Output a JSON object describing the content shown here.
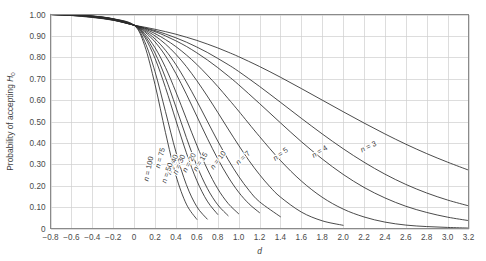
{
  "chart_data": {
    "type": "line",
    "title": "",
    "xlabel": "d",
    "ylabel": "Probability of accepting H0",
    "ylabel_main": "Probability of accepting ",
    "ylabel_symbol": "H",
    "ylabel_subscript": "0",
    "xlim": [
      -0.8,
      3.2
    ],
    "ylim": [
      0,
      1.0
    ],
    "grid": true,
    "legend_position": "inline-curve-labels",
    "x_ticks": [
      "-0.8",
      "-0.6",
      "-0.4",
      "-0.2",
      "0",
      "0.2",
      "0.4",
      "0.6",
      "0.8",
      "1.0",
      "1.2",
      "1.4",
      "1.6",
      "1.8",
      "2.0",
      "2.2",
      "2.4",
      "2.6",
      "2.8",
      "3.0",
      "3.2"
    ],
    "x_tick_values": [
      -0.8,
      -0.6,
      -0.4,
      -0.2,
      0,
      0.2,
      0.4,
      0.6,
      0.8,
      1.0,
      1.2,
      1.4,
      1.6,
      1.8,
      2.0,
      2.2,
      2.4,
      2.6,
      2.8,
      3.0,
      3.2
    ],
    "y_ticks": [
      "0",
      "0.10",
      "0.20",
      "0.30",
      "0.40",
      "0.50",
      "0.60",
      "0.70",
      "0.80",
      "0.90",
      "1.00"
    ],
    "y_tick_values": [
      0,
      0.1,
      0.2,
      0.3,
      0.4,
      0.5,
      0.6,
      0.7,
      0.8,
      0.9,
      1.0
    ],
    "series": [
      {
        "name": "n = 3",
        "label_prefix": "n",
        "label_equals": " = ",
        "label_value": "3",
        "label_x": 2.18,
        "label_y": 0.355,
        "label_rotate": -26,
        "x": [
          -0.8,
          -0.6,
          -0.4,
          -0.2,
          0,
          0.1,
          0.2,
          0.3,
          0.4,
          0.5,
          0.6,
          0.7,
          0.8,
          0.9,
          1.0,
          1.2,
          1.4,
          1.6,
          1.8,
          2.0,
          2.2,
          2.4,
          2.6,
          2.8,
          3.0,
          3.2
        ],
        "values": [
          1.0,
          0.995,
          0.986,
          0.973,
          0.95,
          0.941,
          0.931,
          0.92,
          0.908,
          0.894,
          0.879,
          0.862,
          0.844,
          0.824,
          0.803,
          0.757,
          0.707,
          0.654,
          0.6,
          0.546,
          0.493,
          0.442,
          0.394,
          0.35,
          0.31,
          0.273
        ]
      },
      {
        "name": "n = 4",
        "label_prefix": "n",
        "label_equals": " = ",
        "label_value": "4",
        "label_x": 1.72,
        "label_y": 0.33,
        "label_rotate": -32,
        "x": [
          -0.8,
          -0.6,
          -0.4,
          -0.2,
          0,
          0.1,
          0.2,
          0.3,
          0.4,
          0.5,
          0.6,
          0.7,
          0.8,
          0.9,
          1.0,
          1.2,
          1.4,
          1.6,
          1.8,
          2.0,
          2.2,
          2.4,
          2.6,
          2.8,
          3.0,
          3.2
        ],
        "values": [
          1.0,
          0.996,
          0.988,
          0.974,
          0.95,
          0.938,
          0.925,
          0.909,
          0.891,
          0.871,
          0.848,
          0.823,
          0.795,
          0.766,
          0.734,
          0.664,
          0.59,
          0.515,
          0.442,
          0.373,
          0.31,
          0.254,
          0.206,
          0.166,
          0.133,
          0.106
        ]
      },
      {
        "name": "n = 5",
        "label_prefix": "n",
        "label_equals": " = ",
        "label_value": "5",
        "label_x": 1.35,
        "label_y": 0.315,
        "label_rotate": -37,
        "x": [
          -0.8,
          -0.6,
          -0.4,
          -0.2,
          0,
          0.1,
          0.2,
          0.3,
          0.4,
          0.5,
          0.6,
          0.7,
          0.8,
          0.9,
          1.0,
          1.2,
          1.4,
          1.6,
          1.8,
          2.0,
          2.2,
          2.4,
          2.6,
          2.8,
          3.0,
          3.2
        ],
        "values": [
          1.0,
          0.996,
          0.988,
          0.974,
          0.95,
          0.936,
          0.92,
          0.9,
          0.877,
          0.851,
          0.821,
          0.788,
          0.752,
          0.713,
          0.672,
          0.584,
          0.494,
          0.406,
          0.325,
          0.253,
          0.192,
          0.143,
          0.104,
          0.075,
          0.053,
          0.037
        ]
      },
      {
        "name": "n = 7",
        "label_prefix": "n",
        "label_equals": " = ",
        "label_value": "7",
        "label_x": 1.0,
        "label_y": 0.295,
        "label_rotate": -44,
        "x": [
          -0.8,
          -0.6,
          -0.4,
          -0.2,
          0,
          0.1,
          0.2,
          0.3,
          0.4,
          0.5,
          0.6,
          0.7,
          0.8,
          0.9,
          1.0,
          1.2,
          1.4,
          1.6,
          1.8,
          2.0,
          2.2,
          2.4,
          2.6,
          2.8,
          3.0,
          3.2
        ],
        "values": [
          1.0,
          0.997,
          0.989,
          0.975,
          0.95,
          0.933,
          0.911,
          0.883,
          0.85,
          0.811,
          0.767,
          0.717,
          0.664,
          0.607,
          0.549,
          0.43,
          0.318,
          0.222,
          0.146,
          0.091,
          0.054,
          0.03,
          0.016,
          0.009,
          0.005,
          0.002
        ]
      },
      {
        "name": "n = 10",
        "label_prefix": "n",
        "label_equals": " = ",
        "label_value": "10",
        "label_x": 0.76,
        "label_y": 0.275,
        "label_rotate": -52,
        "x": [
          -0.8,
          -0.6,
          -0.4,
          -0.2,
          0,
          0.1,
          0.2,
          0.3,
          0.4,
          0.5,
          0.6,
          0.7,
          0.8,
          0.9,
          1.0,
          1.1,
          1.2,
          1.3,
          1.4,
          1.6,
          1.8,
          2.0
        ],
        "values": [
          1.0,
          0.997,
          0.99,
          0.976,
          0.95,
          0.929,
          0.9,
          0.862,
          0.814,
          0.757,
          0.691,
          0.619,
          0.543,
          0.465,
          0.389,
          0.317,
          0.252,
          0.195,
          0.147,
          0.077,
          0.036,
          0.015
        ]
      },
      {
        "name": "n = 15",
        "label_prefix": "n",
        "label_equals": " = ",
        "label_value": "15",
        "label_x": 0.6,
        "label_y": 0.265,
        "label_rotate": -58,
        "x": [
          -0.8,
          -0.6,
          -0.4,
          -0.2,
          0,
          0.1,
          0.2,
          0.3,
          0.4,
          0.5,
          0.6,
          0.7,
          0.8,
          0.9,
          1.0,
          1.1,
          1.2,
          1.4
        ],
        "values": [
          1.0,
          0.998,
          0.991,
          0.977,
          0.95,
          0.924,
          0.886,
          0.833,
          0.766,
          0.685,
          0.596,
          0.502,
          0.409,
          0.322,
          0.244,
          0.178,
          0.125,
          0.055
        ]
      },
      {
        "name": "n = 20",
        "label_prefix": "n",
        "label_equals": " = ",
        "label_value": "20",
        "label_x": 0.5,
        "label_y": 0.26,
        "label_rotate": -62,
        "x": [
          -0.8,
          -0.6,
          -0.4,
          -0.2,
          0,
          0.1,
          0.2,
          0.3,
          0.4,
          0.5,
          0.6,
          0.7,
          0.8,
          0.9,
          1.0,
          1.1,
          1.2
        ],
        "values": [
          1.0,
          0.998,
          0.991,
          0.978,
          0.95,
          0.919,
          0.872,
          0.807,
          0.724,
          0.628,
          0.525,
          0.422,
          0.326,
          0.241,
          0.17,
          0.115,
          0.074
        ]
      },
      {
        "name": "n = 30",
        "label_prefix": "n",
        "label_equals": " = ",
        "label_value": "30",
        "label_x": 0.41,
        "label_y": 0.25,
        "label_rotate": -66,
        "x": [
          -0.8,
          -0.6,
          -0.4,
          -0.2,
          0,
          0.1,
          0.2,
          0.3,
          0.4,
          0.5,
          0.6,
          0.7,
          0.8,
          0.9,
          1.0
        ],
        "values": [
          1.0,
          0.998,
          0.992,
          0.978,
          0.95,
          0.911,
          0.845,
          0.753,
          0.638,
          0.513,
          0.389,
          0.278,
          0.186,
          0.117,
          0.069
        ]
      },
      {
        "name": "n = 40",
        "label_prefix": "n",
        "label_equals": " = ",
        "label_value": "40",
        "label_x": 0.35,
        "label_y": 0.25,
        "label_rotate": -69,
        "x": [
          -0.8,
          -0.6,
          -0.4,
          -0.2,
          0,
          0.1,
          0.2,
          0.3,
          0.4,
          0.5,
          0.6,
          0.7,
          0.8,
          0.9
        ],
        "values": [
          1.0,
          0.999,
          0.992,
          0.979,
          0.95,
          0.903,
          0.82,
          0.705,
          0.568,
          0.425,
          0.294,
          0.188,
          0.111,
          0.06
        ]
      },
      {
        "name": "n = 50",
        "label_prefix": "n",
        "label_equals": " = ",
        "label_value": "50",
        "label_x": 0.305,
        "label_y": 0.21,
        "label_rotate": -71,
        "x": [
          -0.8,
          -0.6,
          -0.4,
          -0.2,
          0,
          0.1,
          0.2,
          0.3,
          0.4,
          0.5,
          0.6,
          0.7,
          0.8
        ],
        "values": [
          1.0,
          0.999,
          0.992,
          0.979,
          0.95,
          0.895,
          0.795,
          0.659,
          0.505,
          0.354,
          0.224,
          0.128,
          0.066
        ]
      },
      {
        "name": "n = 75",
        "label_prefix": "n",
        "label_equals": " = ",
        "label_value": "75",
        "label_x": 0.245,
        "label_y": 0.28,
        "label_rotate": -75,
        "x": [
          -0.8,
          -0.6,
          -0.4,
          -0.2,
          0,
          0.1,
          0.2,
          0.3,
          0.4,
          0.5,
          0.6,
          0.7
        ],
        "values": [
          1.0,
          0.999,
          0.993,
          0.98,
          0.95,
          0.875,
          0.733,
          0.547,
          0.358,
          0.205,
          0.102,
          0.044
        ]
      },
      {
        "name": "n = 100",
        "label_prefix": "n",
        "label_equals": " = ",
        "label_value": "100",
        "label_x": 0.135,
        "label_y": 0.22,
        "label_rotate": -78,
        "x": [
          -0.8,
          -0.6,
          -0.4,
          -0.2,
          0,
          0.1,
          0.2,
          0.3,
          0.4,
          0.5,
          0.6
        ],
        "values": [
          1.0,
          0.999,
          0.993,
          0.98,
          0.95,
          0.856,
          0.673,
          0.449,
          0.248,
          0.114,
          0.043
        ]
      }
    ]
  }
}
